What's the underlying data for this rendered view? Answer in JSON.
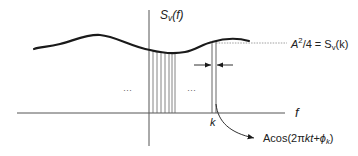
{
  "diagram": {
    "y_axis_label": {
      "base": "S",
      "sub": "v",
      "arg": "(f)"
    },
    "x_axis_label": "f",
    "k_label": "k",
    "ellipsis_left": "···",
    "ellipsis_right": "···",
    "amplitude_label": {
      "A": "A",
      "sup": "2",
      "rest": "/4 = S",
      "sub": "v",
      "arg": "(k)"
    },
    "cosine_label": {
      "prefix": "Acos(2π",
      "kt": "kt",
      "plus": "+",
      "phi": "ϕ",
      "phi_sub": "k",
      "close": ")"
    },
    "colors": {
      "line": "#1a1a1a",
      "axis": "#555555",
      "hatch": "#666666",
      "dashed": "#888888",
      "text": "#222222"
    },
    "hatch_line_count": 7
  }
}
